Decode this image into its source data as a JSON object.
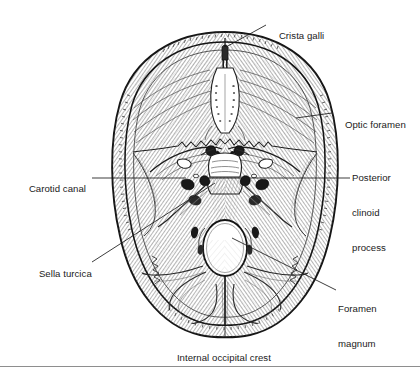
{
  "figure": {
    "view": "superior view of skull base",
    "background_color": "#ffffff",
    "ink_color": "#1a1a1a",
    "rule_color": "#8e8e8e"
  },
  "labels": {
    "crista_galli": {
      "text": "Crista galli",
      "lines": [
        "Crista galli"
      ],
      "position": "top-right",
      "leader": "diagonal"
    },
    "optic_foramen": {
      "text": "Optic foramen",
      "lines": [
        "Optic foramen"
      ],
      "position": "right",
      "leader": "horizontal"
    },
    "posterior_clinoid_process": {
      "text": "Posterior clinoid process",
      "lines": [
        "Posterior",
        "clinoid",
        "process"
      ],
      "position": "right",
      "leader": "horizontal"
    },
    "carotid_canal": {
      "text": "Carotid canal",
      "lines": [
        "Carotid canal"
      ],
      "position": "left",
      "leader": "horizontal"
    },
    "sella_turcica": {
      "text": "Sella turcica",
      "lines": [
        "Sella turcica"
      ],
      "position": "left",
      "leader": "diagonal"
    },
    "foramen_magnum": {
      "text": "Foramen magnum",
      "lines": [
        "Foramen",
        "magnum"
      ],
      "position": "bottom-right",
      "leader": "diagonal"
    },
    "internal_occipital_crest": {
      "text": "Internal occipital crest",
      "lines": [
        "Internal occipital crest"
      ],
      "position": "bottom-center",
      "leader": "vertical"
    }
  }
}
